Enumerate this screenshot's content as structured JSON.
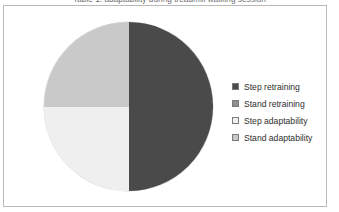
{
  "figure": {
    "title": "Table 1: adaptability during treadmill walking session"
  },
  "chart_data": {
    "type": "pie",
    "title": "Table 1: adaptability during treadmill walking session",
    "categories": [
      "Step retraining",
      "Stand retraining",
      "Step adaptability",
      "Stand adaptability"
    ],
    "values": [
      50,
      0,
      25,
      25
    ],
    "units": "percent",
    "colors": [
      "#4a4a4a",
      "#8f8f8f",
      "#efefef",
      "#c9c9c9"
    ],
    "legend_position": "right",
    "grid": false,
    "start_angle": 0,
    "direction": "clockwise",
    "slices": [
      {
        "label": "Step retraining",
        "value": 50,
        "color": "#4a4a4a",
        "position": "right-half"
      },
      {
        "label": "Stand retraining",
        "value": 0,
        "color": "#8f8f8f",
        "position": "none"
      },
      {
        "label": "Step adaptability",
        "value": 25,
        "color": "#efefef",
        "position": "lower-left-quadrant"
      },
      {
        "label": "Stand adaptability",
        "value": 25,
        "color": "#c9c9c9",
        "position": "upper-left-quadrant"
      }
    ]
  },
  "legend": {
    "items": [
      {
        "label": "Step retraining",
        "color": "#4a4a4a"
      },
      {
        "label": "Stand retraining",
        "color": "#8f8f8f"
      },
      {
        "label": "Step adaptability",
        "color": "#efefef"
      },
      {
        "label": "Stand adaptability",
        "color": "#c9c9c9"
      }
    ]
  }
}
